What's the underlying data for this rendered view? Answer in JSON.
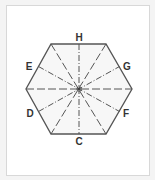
{
  "diagram": {
    "shape": "regular hexagon",
    "center": [
      79,
      89
    ],
    "vertices": [
      [
        51,
        44
      ],
      [
        106,
        44
      ],
      [
        132,
        89
      ],
      [
        106,
        134
      ],
      [
        51,
        134
      ],
      [
        26,
        89
      ]
    ],
    "labels": [
      {
        "id": "H",
        "text": "H",
        "x": 79,
        "y": 41
      },
      {
        "id": "G",
        "text": "G",
        "x": 127,
        "y": 70
      },
      {
        "id": "F",
        "text": "F",
        "x": 126,
        "y": 117
      },
      {
        "id": "C",
        "text": "C",
        "x": 79,
        "y": 145
      },
      {
        "id": "D",
        "text": "D",
        "x": 30,
        "y": 117
      },
      {
        "id": "E",
        "text": "E",
        "x": 29,
        "y": 70
      }
    ],
    "colors": {
      "fill": "#f7f7f7",
      "stroke": "#555555",
      "axis": "#555555",
      "label": "#333333"
    }
  }
}
